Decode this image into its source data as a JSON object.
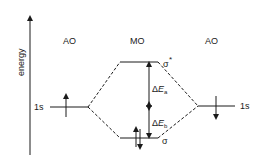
{
  "diagram": {
    "type": "molecular-orbital-energy-diagram",
    "axis": {
      "label": "energy",
      "direction": "up"
    },
    "columns": [
      {
        "id": "left",
        "label": "AO"
      },
      {
        "id": "center",
        "label": "MO"
      },
      {
        "id": "right",
        "label": "AO"
      }
    ],
    "levels": {
      "left_ao": {
        "label": "1s",
        "electrons": "up"
      },
      "right_ao": {
        "label": "1s",
        "electrons": "down"
      },
      "sigma_star": {
        "label": "σ",
        "superscript": "*",
        "electrons": "none"
      },
      "sigma": {
        "label": "σ",
        "electrons": "up-down"
      }
    },
    "energy_gaps": {
      "antibonding": {
        "delta": "Δ",
        "symbol": "E",
        "subscript": "a"
      },
      "bonding": {
        "delta": "Δ",
        "symbol": "E",
        "subscript": "b"
      }
    },
    "colors": {
      "line": "#1a1a1a",
      "background": "#ffffff"
    }
  }
}
